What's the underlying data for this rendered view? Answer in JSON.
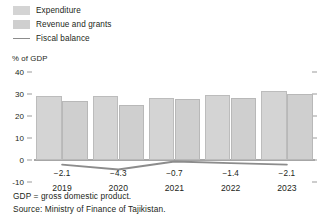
{
  "legend": {
    "items": [
      {
        "label": "Expenditure",
        "marker": "swatch",
        "color": "#d4d4d4"
      },
      {
        "label": "Revenue and grants",
        "marker": "swatch",
        "color": "#cfcfcf"
      },
      {
        "label": "Fiscal balance",
        "marker": "line",
        "color": "#8c8c8c"
      }
    ]
  },
  "axis_title": "% of GDP",
  "footnotes": [
    "GDP = gross domestic product.",
    "Source: Ministry of Finance of Tajikistan."
  ],
  "chart_data": {
    "type": "bar",
    "title": "",
    "subtitle": "",
    "xlabel": "",
    "ylabel": "% of GDP",
    "ylim": [
      -10,
      40
    ],
    "yticks": [
      40,
      30,
      20,
      10,
      0,
      -10
    ],
    "ytick_labels": [
      "40",
      "30",
      "20",
      "10",
      "0",
      "-10"
    ],
    "grid": false,
    "legend_position": "top-left",
    "categories": [
      "2019",
      "2020",
      "2021",
      "2022",
      "2023"
    ],
    "series": [
      {
        "name": "Expenditure",
        "type": "bar",
        "color": "#d4d4d4",
        "values": [
          29.0,
          29.3,
          28.4,
          29.4,
          31.5
        ]
      },
      {
        "name": "Revenue and grants",
        "type": "bar",
        "color": "#cfcfcf",
        "values": [
          26.8,
          25.0,
          27.6,
          28.0,
          30.0
        ]
      },
      {
        "name": "Fiscal balance",
        "type": "line",
        "color": "#8c8c8c",
        "values": [
          -2.1,
          -4.3,
          -0.7,
          -1.4,
          -2.1
        ],
        "data_labels": [
          "-2.1",
          "-4.3",
          "-0.7",
          "-1.4",
          "-2.1"
        ]
      }
    ]
  }
}
